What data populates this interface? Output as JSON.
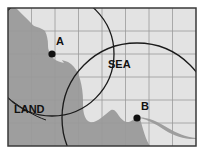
{
  "figure": {
    "name": "land-sea-map-diagram",
    "width": 204,
    "height": 154,
    "background_color": "#ffffff"
  },
  "frame": {
    "x": 8,
    "y": 8,
    "width": 188,
    "height": 138,
    "border_color": "#3a3a3a",
    "border_width": 1.5
  },
  "grid": {
    "columns": 8,
    "rows": 6,
    "cell_width": 23.5,
    "cell_height": 23,
    "line_color": "#9a9a9a",
    "line_width": 0.8,
    "visible": true
  },
  "regions": {
    "sea": {
      "label": "SEA",
      "color": "#e3e3e3",
      "label_x": 108,
      "label_y": 68
    },
    "land": {
      "label": "LAND",
      "color": "#9e9e9e",
      "label_x": 14,
      "label_y": 113
    }
  },
  "points": [
    {
      "label": "A",
      "x": 52,
      "y": 54,
      "radius": 3.6,
      "color": "#111111",
      "label_x": 56,
      "label_y": 45
    },
    {
      "label": "B",
      "x": 137,
      "y": 118,
      "radius": 3.6,
      "color": "#111111",
      "label_x": 141,
      "label_y": 110
    }
  ],
  "circles": [
    {
      "name": "circle-through-a",
      "center_x": 52,
      "center_y": 54,
      "radius": 62,
      "stroke": "#1a1a1a",
      "stroke_width": 1.3
    },
    {
      "name": "circle-through-b",
      "center_x": 137,
      "center_y": 118,
      "radius": 75,
      "stroke": "#1a1a1a",
      "stroke_width": 1.3
    }
  ],
  "coastline": {
    "name": "coastline-path",
    "stroke": "none",
    "description": "boundary between land and sea"
  }
}
